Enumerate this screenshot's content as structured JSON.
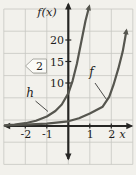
{
  "figure": {
    "callout_number": "2"
  },
  "colors": {
    "paper": "#f2f1ec",
    "grid": "#c6c6c2",
    "axis": "#262624",
    "curve": "#56564F",
    "text": "#1e1e1c",
    "leader": "#3a3a38",
    "callout_border": "#a9a9a3",
    "callout_fill": "#fbfbf7",
    "callout_shadow": "#d2d2cb"
  },
  "chart_data": {
    "type": "line",
    "title": "",
    "xlabel": "x",
    "ylabel": "f(x)",
    "xlim": [
      -3,
      3
    ],
    "ylim": [
      0,
      28
    ],
    "grid": true,
    "x_ticks": [
      {
        "v": -2,
        "label": "-2"
      },
      {
        "v": -1,
        "label": "-1"
      },
      {
        "v": 1,
        "label": "1"
      },
      {
        "v": 2,
        "label": "2"
      }
    ],
    "y_ticks": [
      {
        "v": 10,
        "label": "10"
      },
      {
        "v": 15,
        "label": "15"
      },
      {
        "v": 20,
        "label": "20"
      }
    ],
    "series": [
      {
        "name": "h",
        "label_side": "left",
        "points": [
          [
            -2.95,
            0.15
          ],
          [
            -2.5,
            0.35
          ],
          [
            -2,
            0.65
          ],
          [
            -1.5,
            1.2
          ],
          [
            -1,
            2.2
          ],
          [
            -0.6,
            3.5
          ],
          [
            -0.3,
            5.0
          ],
          [
            0,
            7.6
          ],
          [
            0.2,
            10.5
          ],
          [
            0.4,
            14.5
          ],
          [
            0.6,
            19.5
          ],
          [
            0.8,
            24.5
          ],
          [
            1.0,
            28.3
          ]
        ]
      },
      {
        "name": "f",
        "label_side": "right",
        "points": [
          [
            -2.95,
            0.12
          ],
          [
            -2,
            0.3
          ],
          [
            -1,
            0.55
          ],
          [
            0,
            1.1
          ],
          [
            0.5,
            1.8
          ],
          [
            1,
            2.9
          ],
          [
            1.6,
            4.5
          ],
          [
            1.9,
            6.8
          ],
          [
            2.1,
            9.5
          ],
          [
            2.33,
            13.4
          ],
          [
            2.53,
            17.3
          ],
          [
            2.64,
            20.4
          ],
          [
            2.72,
            22.7
          ]
        ]
      }
    ],
    "annotations": [
      {
        "type": "callout-tag",
        "text": "2"
      }
    ]
  }
}
